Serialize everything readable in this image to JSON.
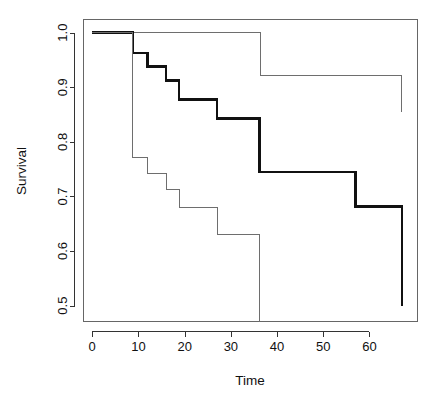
{
  "figure": {
    "background": "#ffffff",
    "plot_box": {
      "left": 83,
      "right": 418,
      "top": 19,
      "bottom": 322
    },
    "frame_color": "#555555",
    "axis_color": "#333333"
  },
  "chart_data": {
    "type": "line",
    "title": "",
    "subtitle": "",
    "xlabel": "Time",
    "ylabel": "Survival",
    "xlim": [
      -2.0,
      70.5
    ],
    "ylim": [
      0.47,
      1.025
    ],
    "xticks": [
      0,
      10,
      20,
      30,
      40,
      50,
      60
    ],
    "xtick_labels": [
      "0",
      "10",
      "20",
      "30",
      "40",
      "50",
      "60"
    ],
    "yticks": [
      0.5,
      0.6,
      0.7,
      0.8,
      0.9,
      1.0
    ],
    "ytick_labels": [
      "0.5",
      "0.6",
      "0.7",
      "0.8",
      "0.9",
      "1.0"
    ],
    "grid": false,
    "legend": "none",
    "step_style": "post",
    "series": [
      {
        "name": "upper-confidence-band",
        "role": "upper band",
        "color": "#6e6e6e",
        "width": 1.0,
        "x": [
          0,
          8.8,
          36.5,
          57.0,
          67.0
        ],
        "y": [
          1.0,
          1.0,
          0.922,
          0.922,
          0.88
        ],
        "final_drop_y": 0.855
      },
      {
        "name": "estimate-bold",
        "role": "survival estimate",
        "color": "#111111",
        "width": 2.6,
        "x": [
          0,
          8.8,
          12.0,
          16.0,
          18.8,
          27.0,
          35.0,
          36.2,
          57.0,
          67.0
        ],
        "y": [
          1.0,
          0.963,
          0.938,
          0.912,
          0.878,
          0.843,
          0.843,
          0.745,
          0.682,
          0.6
        ],
        "final_drop_y": 0.5
      },
      {
        "name": "lower-confidence-band",
        "role": "lower band",
        "color": "#6e6e6e",
        "width": 1.0,
        "x": [
          0,
          8.8,
          12.0,
          16.0,
          18.8,
          27.0,
          35.2,
          36.2
        ],
        "y": [
          1.0,
          0.772,
          0.742,
          0.712,
          0.68,
          0.63,
          0.63,
          0.522
        ],
        "final_drop_y": 0.47
      }
    ],
    "annotations": []
  }
}
